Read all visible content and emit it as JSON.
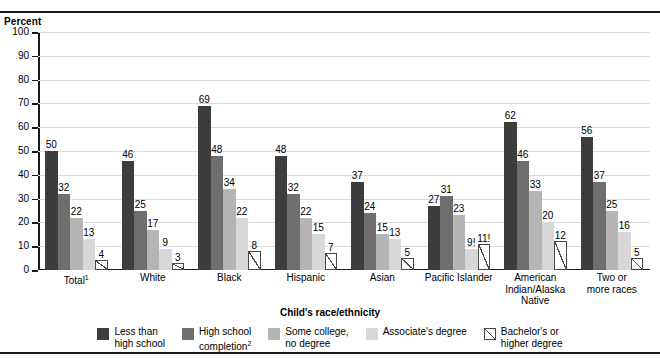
{
  "chart_data": {
    "type": "bar",
    "title": "",
    "ylabel": "Percent",
    "xlabel": "Child's race/ethnicity",
    "ylim": [
      0,
      100
    ],
    "ytick_step": 10,
    "yticks": [
      "100",
      "90",
      "80",
      "70",
      "60",
      "50",
      "40",
      "30",
      "20",
      "10",
      "0"
    ],
    "grid": true,
    "legend_position": "bottom",
    "categories": [
      "Total¹",
      "White",
      "Black",
      "Hispanic",
      "Asian",
      "Pacific Islander",
      "American\nIndian/Alaska\nNative",
      "Two or\nmore races"
    ],
    "series": [
      {
        "name": "Less than high school",
        "legend_label": "Less than\nhigh school",
        "color": "#3d3d3d",
        "values": [
          50,
          46,
          69,
          48,
          37,
          27,
          62,
          56
        ],
        "labels": [
          "50",
          "46",
          "69",
          "48",
          "37",
          "27",
          "62",
          "56"
        ]
      },
      {
        "name": "High school completion²",
        "legend_label": "High school\ncompletion²",
        "color": "#6e6e6e",
        "values": [
          32,
          25,
          48,
          32,
          24,
          31,
          46,
          37
        ],
        "labels": [
          "32",
          "25",
          "48",
          "32",
          "24",
          "31",
          "46",
          "37"
        ]
      },
      {
        "name": "Some college, no degree",
        "legend_label": "Some college,\nno degree",
        "color": "#b5b5b5",
        "values": [
          22,
          17,
          34,
          22,
          15,
          23,
          33,
          25
        ],
        "labels": [
          "22",
          "17",
          "34",
          "22",
          "15",
          "23",
          "33",
          "25"
        ]
      },
      {
        "name": "Associate's degree",
        "legend_label": "Associate's degree",
        "color": "#d8d8d8",
        "values": [
          13,
          9,
          22,
          15,
          13,
          9,
          20,
          16
        ],
        "labels": [
          "13",
          "9",
          "22",
          "15",
          "13",
          "9!",
          "20",
          "16"
        ]
      },
      {
        "name": "Bachelor's or higher degree",
        "legend_label": "Bachelor's or\nhigher degree",
        "color": "#ffffff",
        "hatch": "diagonal",
        "values": [
          4,
          3,
          8,
          7,
          5,
          11,
          12,
          5
        ],
        "labels": [
          "4",
          "3",
          "8",
          "7",
          "5",
          "11!",
          "12",
          "5"
        ]
      }
    ]
  }
}
